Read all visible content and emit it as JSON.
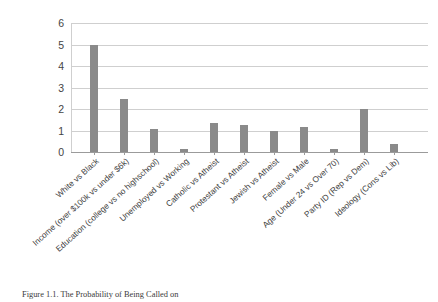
{
  "caption": {
    "figure_number": "Figure 1.1.",
    "title": "The Probability of Being Called on"
  },
  "chart_data": {
    "type": "bar",
    "title": "",
    "xlabel": "",
    "ylabel": "",
    "ylim": [
      0,
      6
    ],
    "ytick_labels": [
      "0",
      "1",
      "2",
      "3",
      "4",
      "5",
      "6"
    ],
    "ytick_values": [
      0,
      1,
      2,
      3,
      4,
      5,
      6
    ],
    "grid": true,
    "legend": "none",
    "bar_color": "#8a8a8a",
    "gridline_color": "#cfcfcf",
    "categories": [
      "White vs Black",
      "Income (over $100k vs under $6k)",
      "Education (college vs no highschool)",
      "Unemployed vs Working",
      "Catholic vs Atheist",
      "Protestant vs Atheist",
      "Jewish vs Atheist",
      "Female vs Male",
      "Age (Under 24 vs Over 70)",
      "Party ID (Rep vs Dem)",
      "Ideology (Cons vs Lib)"
    ],
    "values": [
      5.0,
      2.45,
      1.07,
      0.15,
      1.35,
      1.25,
      0.97,
      1.15,
      0.15,
      1.98,
      0.35
    ]
  }
}
